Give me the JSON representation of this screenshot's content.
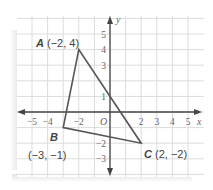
{
  "diagram": {
    "type": "coordinate-plane-triangle",
    "axes": {
      "x_label": "x",
      "y_label": "y",
      "origin_label": "O",
      "x_ticks": [
        {
          "value": -5,
          "label": "−5"
        },
        {
          "value": -4,
          "label": "−4"
        },
        {
          "value": -2,
          "label": "−2"
        },
        {
          "value": 2,
          "label": "2"
        },
        {
          "value": 3,
          "label": "3"
        },
        {
          "value": 4,
          "label": "4"
        },
        {
          "value": 5,
          "label": "5"
        }
      ],
      "y_ticks": [
        {
          "value": 5,
          "label": "5"
        },
        {
          "value": 4,
          "label": "4"
        },
        {
          "value": 3,
          "label": "3"
        },
        {
          "value": 1,
          "label": "1"
        },
        {
          "value": -2,
          "label": "−2"
        },
        {
          "value": -3,
          "label": "−3"
        }
      ]
    },
    "points": [
      {
        "name": "A",
        "x": -2,
        "y": 4,
        "coords_label": "(−2, 4)"
      },
      {
        "name": "B",
        "x": -3,
        "y": -1,
        "coords_label": "(−3, −1)"
      },
      {
        "name": "C",
        "x": 2,
        "y": -2,
        "coords_label": "C (2, −2)"
      }
    ],
    "colors": {
      "grid": "#d9d9d9",
      "axis": "#444444",
      "triangle": "#555555",
      "text": "#444444"
    }
  }
}
